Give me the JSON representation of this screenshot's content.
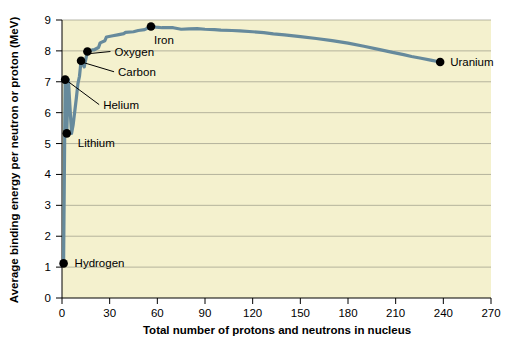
{
  "chart_data": {
    "type": "line",
    "title": "",
    "xlabel": "Total number of protons and neutrons in nucleus",
    "ylabel": "Average binding energy per neutron or proton (MeV)",
    "xlim": [
      0,
      270
    ],
    "ylim": [
      0,
      9
    ],
    "xticks": [
      0,
      30,
      60,
      90,
      120,
      150,
      180,
      210,
      240,
      270
    ],
    "yticks": [
      0,
      1,
      2,
      3,
      4,
      5,
      6,
      7,
      8,
      9
    ],
    "grid": "horizontal",
    "legend": "none",
    "plot_background": "#f4f1ce",
    "line_color": "#668a9c",
    "marker_color": "#000000",
    "series": [
      {
        "name": "Binding energy per nucleon",
        "x": [
          1,
          2,
          3,
          4,
          6,
          7,
          9,
          10,
          11,
          12,
          14,
          16,
          19,
          20,
          23,
          24,
          27,
          28,
          32,
          35,
          39,
          40,
          45,
          48,
          52,
          56,
          59,
          63,
          70,
          75,
          80,
          85,
          90,
          96,
          100,
          107,
          112,
          120,
          127,
          133,
          140,
          150,
          160,
          170,
          180,
          190,
          200,
          208,
          215,
          220,
          226,
          232,
          238
        ],
        "y": [
          1.12,
          7.07,
          5.33,
          7.07,
          5.33,
          5.6,
          6.46,
          6.93,
          7.18,
          7.68,
          7.48,
          7.98,
          8.03,
          8.03,
          8.11,
          8.26,
          8.33,
          8.45,
          8.49,
          8.52,
          8.56,
          8.6,
          8.62,
          8.66,
          8.69,
          8.79,
          8.77,
          8.75,
          8.75,
          8.7,
          8.71,
          8.72,
          8.7,
          8.69,
          8.67,
          8.66,
          8.65,
          8.62,
          8.59,
          8.55,
          8.52,
          8.46,
          8.4,
          8.33,
          8.25,
          8.15,
          8.04,
          7.95,
          7.88,
          7.82,
          7.76,
          7.7,
          7.64
        ]
      }
    ],
    "annotations": [
      {
        "id": "hydrogen",
        "label": "Hydrogen",
        "x": 1,
        "y": 1.12,
        "label_dx": 11,
        "label_dy": 4,
        "leader": false
      },
      {
        "id": "lithium",
        "label": "Lithium",
        "x": 3,
        "y": 5.33,
        "label_dx": 11,
        "label_dy": 14,
        "leader": false
      },
      {
        "id": "helium",
        "label": "Helium",
        "x": 2,
        "y": 7.07,
        "label_dx": 38,
        "label_dy": 29,
        "leader": true
      },
      {
        "id": "carbon",
        "label": "Carbon",
        "x": 12,
        "y": 7.68,
        "label_dx": 37,
        "label_dy": 15,
        "leader": true
      },
      {
        "id": "oxygen",
        "label": "Oxygen",
        "x": 16,
        "y": 7.98,
        "label_dx": 27,
        "label_dy": 4,
        "leader": true
      },
      {
        "id": "iron",
        "label": "Iron",
        "x": 56,
        "y": 8.79,
        "label_dx": 3,
        "label_dy": 18,
        "leader": false
      },
      {
        "id": "uranium",
        "label": "Uranium",
        "x": 238,
        "y": 7.64,
        "label_dx": 10,
        "label_dy": 4,
        "leader": false
      }
    ]
  },
  "axes": {
    "x_tick_labels": [
      "0",
      "30",
      "60",
      "90",
      "120",
      "150",
      "180",
      "210",
      "240",
      "270"
    ],
    "y_tick_labels": [
      "0",
      "1",
      "2",
      "3",
      "4",
      "5",
      "6",
      "7",
      "8",
      "9"
    ],
    "x_title": "Total number of protons and neutrons in nucleus",
    "y_title": "Average binding energy per neutron or proton (MeV)"
  }
}
